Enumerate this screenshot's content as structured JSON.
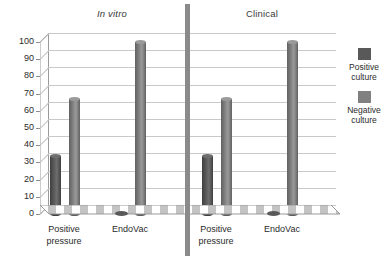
{
  "chart_data": {
    "type": "bar",
    "title": "",
    "subtitle": "",
    "xlabel": "",
    "ylabel": "",
    "ylim": [
      0,
      100
    ],
    "ytick_step": 10,
    "yticks": [
      "100",
      "90",
      "80",
      "70",
      "60",
      "50",
      "40",
      "30",
      "20",
      "10",
      "0"
    ],
    "grid": true,
    "legend_position": "right",
    "panels": [
      {
        "name": "In vitro",
        "title_style": "italic",
        "categories": [
          "Positive\npressure",
          "EndoVac"
        ],
        "series": [
          {
            "name": "Positive culture",
            "values": [
              34,
              1
            ]
          },
          {
            "name": "Negative culture",
            "values": [
              67,
              100
            ]
          }
        ]
      },
      {
        "name": "Clinical",
        "title_style": "normal",
        "categories": [
          "Positive\npressure",
          "EndoVac"
        ],
        "series": [
          {
            "name": "Positive culture",
            "values": [
              34,
              1
            ]
          },
          {
            "name": "Negative culture",
            "values": [
              67,
              100
            ]
          }
        ]
      }
    ],
    "legend": [
      {
        "label": "Positive\nculture",
        "color": "#595959"
      },
      {
        "label": "Negative\nculture",
        "color": "#808080"
      }
    ],
    "colors": {
      "positive_culture": "#595959",
      "negative_culture": "#808080",
      "gridline": "#c9c9c9",
      "axis": "#8d8d8d",
      "divider": "#8a8a8a",
      "background": "#ffffff",
      "text": "#2b2b2b"
    }
  }
}
